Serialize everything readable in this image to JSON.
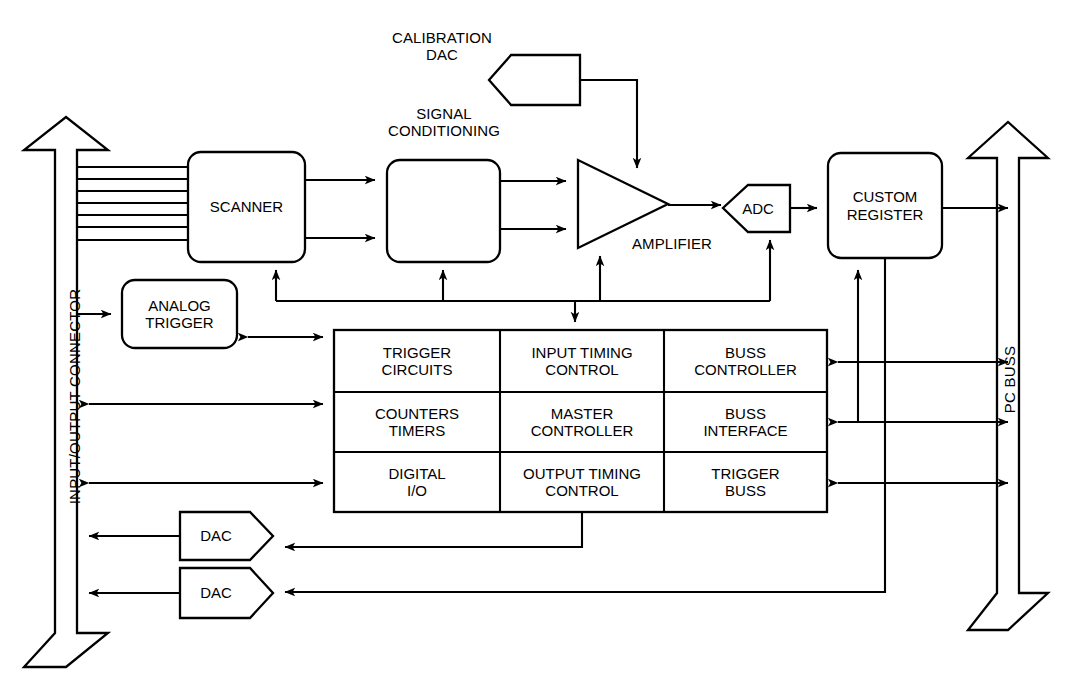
{
  "diagram": {
    "stroke_color": "#000000",
    "background_color": "#ffffff"
  },
  "connectors": {
    "left": {
      "label": "INPUT/OUTPUT CONNECTOR",
      "shape": "double-headed-vertical-arrow"
    },
    "right": {
      "label": "PC BUSS",
      "shape": "double-headed-vertical-arrow"
    }
  },
  "blocks": {
    "scanner": {
      "label": "SCANNER",
      "shape": "rounded-rect"
    },
    "signal_conditioning": {
      "label": "",
      "caption": "SIGNAL\nCONDITIONING",
      "shape": "rounded-rect"
    },
    "calibration_dac": {
      "label": "",
      "caption": "CALIBRATION\nDAC",
      "shape": "pentagon-left"
    },
    "amplifier": {
      "label": "",
      "caption": "AMPLIFIER",
      "shape": "triangle-right"
    },
    "adc": {
      "label": "ADC",
      "shape": "pentagon-left"
    },
    "custom_register": {
      "label": "CUSTOM\nREGISTER",
      "shape": "rounded-rect"
    },
    "analog_trigger": {
      "label": "ANALOG\nTRIGGER",
      "shape": "rounded-rect"
    },
    "dac1": {
      "label": "DAC",
      "shape": "pentagon-right"
    },
    "dac2": {
      "label": "DAC",
      "shape": "pentagon-right"
    }
  },
  "control_grid": {
    "rows": [
      [
        {
          "label": "TRIGGER\nCIRCUITS"
        },
        {
          "label": "INPUT TIMING\nCONTROL"
        },
        {
          "label": "BUSS\nCONTROLLER"
        }
      ],
      [
        {
          "label": "COUNTERS\nTIMERS"
        },
        {
          "label": "MASTER\nCONTROLLER"
        },
        {
          "label": "BUSS\nINTERFACE"
        }
      ],
      [
        {
          "label": "DIGITAL\nI/O"
        },
        {
          "label": "OUTPUT TIMING\nCONTROL"
        },
        {
          "label": "TRIGGER\nBUSS"
        }
      ]
    ]
  }
}
